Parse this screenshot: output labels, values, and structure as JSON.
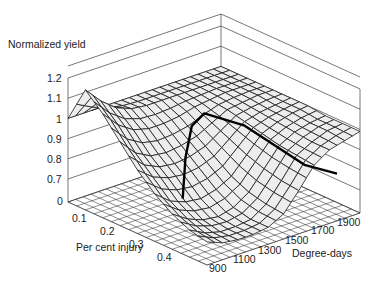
{
  "chart_data": {
    "type": "surface3d",
    "title": "",
    "zlabel": "Normalized yield",
    "xlabel": "Per cent injury",
    "ylabel": "Degree-days",
    "z_ticks": [
      "0",
      "0.7",
      "0.8",
      "0.9",
      "1",
      "1.1",
      "1.2"
    ],
    "x_ticks": [
      "0.1",
      "0.2",
      "0.3",
      "0.4"
    ],
    "y_ticks": [
      "900",
      "1100",
      "1300",
      "1500",
      "1700",
      "1900"
    ],
    "zlim": [
      0.65,
      1.2
    ],
    "x": [
      0.0,
      0.05,
      0.1,
      0.15,
      0.2,
      0.25,
      0.3,
      0.35,
      0.4
    ],
    "y": [
      900,
      1000,
      1100,
      1200,
      1300,
      1400,
      1500,
      1600,
      1700,
      1800,
      1900
    ],
    "z": [
      [
        1.0,
        1.0,
        1.0,
        1.0,
        1.0,
        1.0,
        1.0,
        1.0,
        1.0,
        1.0,
        1.0
      ],
      [
        1.18,
        1.1,
        1.04,
        1.01,
        1.0,
        1.0,
        1.0,
        1.0,
        1.0,
        1.0,
        1.0
      ],
      [
        1.1,
        1.02,
        0.97,
        0.95,
        0.95,
        0.96,
        0.98,
        0.99,
        1.0,
        1.0,
        1.0
      ],
      [
        1.0,
        0.92,
        0.88,
        0.87,
        0.88,
        0.9,
        0.94,
        0.98,
        0.99,
        1.0,
        1.0
      ],
      [
        0.9,
        0.84,
        0.81,
        0.8,
        0.81,
        0.84,
        0.9,
        0.96,
        0.98,
        0.99,
        1.0
      ],
      [
        0.82,
        0.76,
        0.73,
        0.72,
        0.74,
        0.78,
        0.86,
        0.94,
        0.97,
        0.99,
        1.0
      ],
      [
        0.76,
        0.71,
        0.68,
        0.67,
        0.69,
        0.74,
        0.83,
        0.92,
        0.96,
        0.98,
        0.99
      ],
      [
        0.72,
        0.68,
        0.66,
        0.66,
        0.67,
        0.72,
        0.81,
        0.91,
        0.95,
        0.98,
        0.99
      ],
      [
        0.7,
        0.67,
        0.66,
        0.66,
        0.67,
        0.71,
        0.8,
        0.9,
        0.95,
        0.97,
        0.99
      ]
    ],
    "highlight_curve": {
      "description": "Bold line across surface at yield ~ 0.9-1.0",
      "points": [
        {
          "injury": 0.33,
          "dd": 900,
          "z": 0.86
        },
        {
          "injury": 0.25,
          "dd": 1100,
          "z": 0.95
        },
        {
          "injury": 0.18,
          "dd": 1300,
          "z": 1.0
        },
        {
          "injury": 0.15,
          "dd": 1450,
          "z": 1.0
        },
        {
          "injury": 0.22,
          "dd": 1550,
          "z": 0.97
        },
        {
          "injury": 0.35,
          "dd": 1650,
          "z": 0.85
        },
        {
          "injury": 0.4,
          "dd": 1750,
          "z": 0.82
        }
      ]
    },
    "grid": true,
    "legend": null
  },
  "labels": {
    "zlabel": "Normalized yield",
    "xlabel": "Per cent injury",
    "ylabel": "Degree-days",
    "z_ticks": [
      "1.2",
      "1.1",
      "1",
      "0.9",
      "0.8",
      "0.7",
      "0"
    ],
    "x_ticks": [
      "0.1",
      "0.2",
      "0.3",
      "0.4"
    ],
    "y_ticks": [
      "900",
      "1100",
      "1300",
      "1500",
      "1700",
      "1900"
    ]
  }
}
